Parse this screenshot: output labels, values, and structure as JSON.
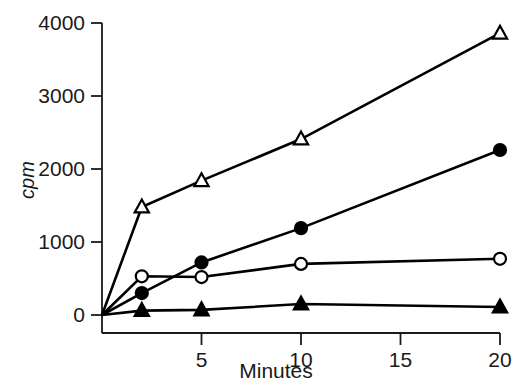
{
  "chart_data": {
    "type": "line",
    "title": "",
    "subtitle": "",
    "xlabel": "Minutes",
    "ylabel": "cpm",
    "xlim": [
      0,
      20
    ],
    "ylim": [
      0,
      4000
    ],
    "xticks": [
      5,
      10,
      15,
      20
    ],
    "xtick_labels": [
      "5",
      "10",
      "15",
      "20"
    ],
    "yticks": [
      0,
      1000,
      2000,
      3000,
      4000
    ],
    "ytick_labels": [
      "0",
      "1000",
      "2000",
      "3000",
      "4000"
    ],
    "grid": false,
    "legend": "none",
    "x": [
      0,
      2,
      5,
      10,
      20
    ],
    "series": [
      {
        "name": "open-triangle",
        "marker": "triangle-open",
        "color": "#000000",
        "values": [
          0,
          1480,
          1840,
          2410,
          3860
        ]
      },
      {
        "name": "filled-circle",
        "marker": "circle-filled",
        "color": "#000000",
        "values": [
          0,
          300,
          720,
          1190,
          2260
        ]
      },
      {
        "name": "open-circle",
        "marker": "circle-open",
        "color": "#000000",
        "values": [
          0,
          530,
          520,
          700,
          770
        ]
      },
      {
        "name": "filled-triangle",
        "marker": "triangle-filled",
        "color": "#000000",
        "values": [
          0,
          60,
          70,
          150,
          110
        ]
      }
    ]
  },
  "figure": {
    "background": "#ffffff",
    "foreground": "#1a1a1a"
  }
}
